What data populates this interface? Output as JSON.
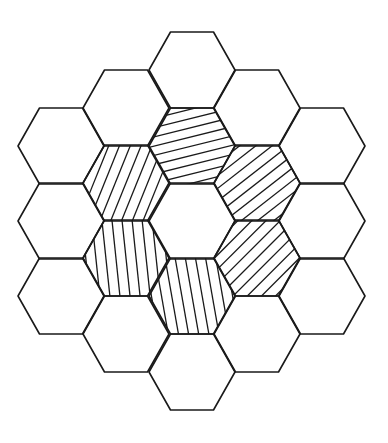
{
  "diagram": {
    "title": "",
    "stroke_color": "#1a1a1a",
    "background": "#ffffff",
    "hex_radius": 43,
    "cells": [
      {
        "id": "c-2-0",
        "cx": 61,
        "cy": 146,
        "hatched": false
      },
      {
        "id": "c-2-1",
        "cx": 61,
        "cy": 221,
        "hatched": false
      },
      {
        "id": "c-2-2",
        "cx": 61,
        "cy": 296,
        "hatched": false
      },
      {
        "id": "c-1-0",
        "cx": 126,
        "cy": 108,
        "hatched": false
      },
      {
        "id": "c-1-1",
        "cx": 126,
        "cy": 183,
        "hatched": true,
        "angle": 68,
        "spacing": 10
      },
      {
        "id": "c-1-2",
        "cx": 126,
        "cy": 258,
        "hatched": true,
        "angle": 96,
        "spacing": 10
      },
      {
        "id": "c-1-3",
        "cx": 126,
        "cy": 334,
        "hatched": false
      },
      {
        "id": "c0-0",
        "cx": 192,
        "cy": 70,
        "hatched": false
      },
      {
        "id": "c0-1",
        "cx": 192,
        "cy": 146,
        "hatched": true,
        "angle": 14,
        "spacing": 9
      },
      {
        "id": "c0-2",
        "cx": 192,
        "cy": 221,
        "hatched": false
      },
      {
        "id": "c0-3",
        "cx": 192,
        "cy": 296,
        "hatched": true,
        "angle": 100,
        "spacing": 10
      },
      {
        "id": "c0-4",
        "cx": 192,
        "cy": 372,
        "hatched": false
      },
      {
        "id": "c1-0",
        "cx": 257,
        "cy": 108,
        "hatched": false
      },
      {
        "id": "c1-1",
        "cx": 257,
        "cy": 183,
        "hatched": true,
        "angle": 38,
        "spacing": 10
      },
      {
        "id": "c1-2",
        "cx": 257,
        "cy": 258,
        "hatched": true,
        "angle": 45,
        "spacing": 10
      },
      {
        "id": "c1-3",
        "cx": 257,
        "cy": 334,
        "hatched": false
      },
      {
        "id": "c2-0",
        "cx": 322,
        "cy": 146,
        "hatched": false
      },
      {
        "id": "c2-1",
        "cx": 322,
        "cy": 221,
        "hatched": false
      },
      {
        "id": "c2-2",
        "cx": 322,
        "cy": 296,
        "hatched": false
      }
    ]
  }
}
